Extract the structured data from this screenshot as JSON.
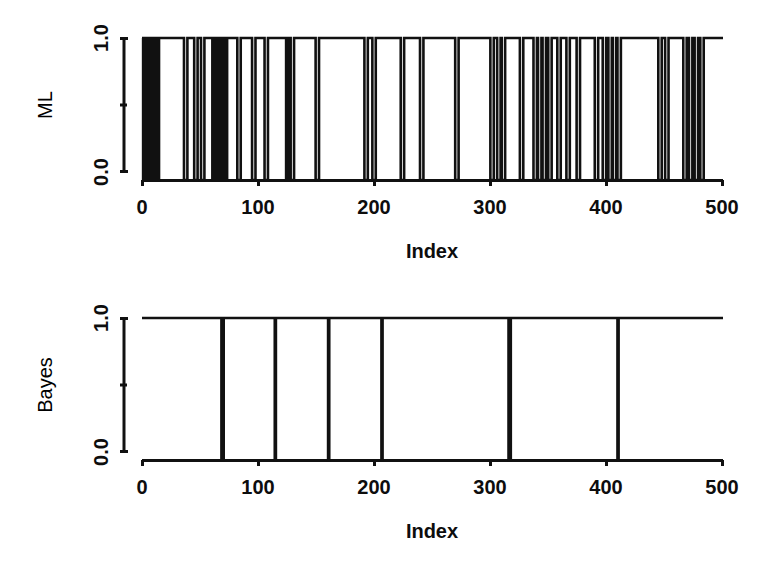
{
  "figure": {
    "title": "",
    "background_color": "#ffffff",
    "ink_color": "#111111",
    "panels": [
      {
        "id": "ml-panel",
        "ylabel": "ML",
        "xlabel": "Index"
      },
      {
        "id": "bayes-panel",
        "ylabel": "Bayes",
        "xlabel": "Index"
      }
    ]
  },
  "chart_data": [
    {
      "type": "line",
      "id": "ml-step-plot",
      "title": "",
      "subtitle": "",
      "xlabel": "Index",
      "ylabel": "ML",
      "xlim": [
        0,
        512
      ],
      "ylim": [
        0,
        1
      ],
      "xticks": [
        0,
        100,
        200,
        300,
        400,
        500
      ],
      "xtick_labels": [
        "0",
        "100",
        "200",
        "300",
        "400",
        "500"
      ],
      "yticks": [
        0.0,
        0.5,
        1.0
      ],
      "ytick_labels": [
        "0.0",
        "",
        "1.0"
      ],
      "grid": false,
      "legend": "none",
      "line_color": "#111111",
      "line_width": 2,
      "step": "hv",
      "note": "Binary 0/1 classification indicator series; value is 1 except in the listed zero-valued index intervals",
      "zero_intervals": [
        [
          1,
          3
        ],
        [
          4,
          6
        ],
        [
          7,
          9
        ],
        [
          10,
          12
        ],
        [
          13,
          15
        ],
        [
          37,
          40
        ],
        [
          46,
          49
        ],
        [
          52,
          55
        ],
        [
          62,
          64
        ],
        [
          66,
          67
        ],
        [
          69,
          71
        ],
        [
          73,
          75
        ],
        [
          84,
          87
        ],
        [
          97,
          100
        ],
        [
          108,
          111
        ],
        [
          127,
          129
        ],
        [
          131,
          134
        ],
        [
          153,
          156
        ],
        [
          196,
          199
        ],
        [
          203,
          206
        ],
        [
          228,
          231
        ],
        [
          245,
          248
        ],
        [
          276,
          279
        ],
        [
          307,
          310
        ],
        [
          313,
          316
        ],
        [
          317,
          320
        ],
        [
          333,
          336
        ],
        [
          345,
          348
        ],
        [
          349,
          352
        ],
        [
          353,
          356
        ],
        [
          358,
          361
        ],
        [
          366,
          369
        ],
        [
          374,
          377
        ],
        [
          383,
          386
        ],
        [
          399,
          402
        ],
        [
          406,
          409
        ],
        [
          411,
          414
        ],
        [
          415,
          418
        ],
        [
          419,
          422
        ],
        [
          455,
          458
        ],
        [
          461,
          464
        ],
        [
          477,
          480
        ],
        [
          482,
          485
        ],
        [
          487,
          490
        ],
        [
          492,
          495
        ]
      ]
    },
    {
      "type": "line",
      "id": "bayes-step-plot",
      "title": "",
      "subtitle": "",
      "xlabel": "Index",
      "ylabel": "Bayes",
      "xlim": [
        0,
        512
      ],
      "ylim": [
        0,
        1
      ],
      "xticks": [
        0,
        100,
        200,
        300,
        400,
        500
      ],
      "xtick_labels": [
        "0",
        "100",
        "200",
        "300",
        "400",
        "500"
      ],
      "yticks": [
        0.0,
        0.5,
        1.0
      ],
      "ytick_labels": [
        "0.0",
        "",
        "1.0"
      ],
      "grid": false,
      "legend": "none",
      "line_color": "#111111",
      "line_width": 2,
      "step": "hv",
      "note": "Binary 0/1 classification indicator series; value is 1 except at the listed isolated zero indices",
      "zero_intervals": [
        [
          70,
          72
        ],
        [
          117,
          118
        ],
        [
          164,
          165
        ],
        [
          211,
          212
        ],
        [
          323,
          325
        ],
        [
          419,
          420
        ]
      ]
    }
  ]
}
